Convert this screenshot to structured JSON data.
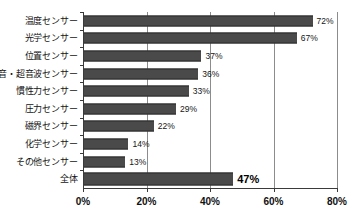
{
  "chart_data": {
    "type": "bar",
    "orientation": "horizontal",
    "title": "",
    "xlabel": "",
    "ylabel": "",
    "categories": [
      "温度センサー",
      "光学センサー",
      "位置センサー",
      "音・超音波センサー",
      "慣性力センサー",
      "圧力センサー",
      "磁界センサー",
      "化学センサー",
      "その他センサー",
      "全体"
    ],
    "values": [
      72,
      67,
      37,
      36,
      33,
      29,
      22,
      14,
      13,
      47
    ],
    "value_labels": [
      "72%",
      "67%",
      "37%",
      "36%",
      "33%",
      "29%",
      "22%",
      "14%",
      "13%",
      "47%"
    ],
    "emphasis_index": 9,
    "xlim": [
      0,
      80
    ],
    "xticks": [
      0,
      20,
      40,
      60,
      80
    ],
    "xtick_labels": [
      "0%",
      "20%",
      "40%",
      "60%",
      "80%"
    ],
    "grid": "vertical",
    "legend": "none",
    "bar_color": "#4a4a4a",
    "grid_color": "#8c8c8c",
    "axis_color": "#3a3a3a",
    "background": "#ffffff"
  }
}
